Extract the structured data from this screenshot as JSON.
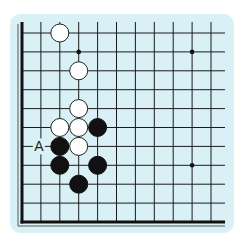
{
  "diagram": {
    "type": "go-board-corner",
    "board_bg": "#d9f1f6",
    "grid": {
      "columns": 11,
      "rows": 11,
      "origin_x": 22,
      "origin_y": 33,
      "spacing": 18.9
    },
    "star_points": [
      {
        "col": 3,
        "row": 1
      },
      {
        "col": 9,
        "row": 1
      },
      {
        "col": 9,
        "row": 7
      }
    ],
    "white_stones": [
      {
        "col": 2,
        "row": 0
      },
      {
        "col": 3,
        "row": 2
      },
      {
        "col": 3,
        "row": 4
      },
      {
        "col": 2,
        "row": 5
      },
      {
        "col": 3,
        "row": 5
      },
      {
        "col": 3,
        "row": 6
      }
    ],
    "black_stones": [
      {
        "col": 4,
        "row": 5
      },
      {
        "col": 2,
        "row": 6
      },
      {
        "col": 2,
        "row": 7
      },
      {
        "col": 4,
        "row": 7
      },
      {
        "col": 3,
        "row": 8
      }
    ],
    "labels": [
      {
        "text": "A",
        "col": 1,
        "row": 6
      }
    ]
  }
}
